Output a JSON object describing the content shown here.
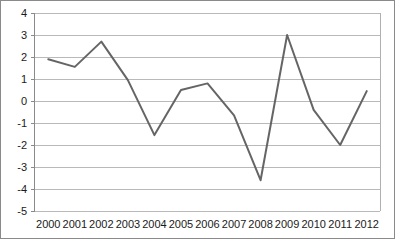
{
  "chart_data": {
    "type": "line",
    "title": "",
    "subtitle": "",
    "xlabel": "",
    "ylabel": "",
    "categories": [
      "2000",
      "2001",
      "2002",
      "2003",
      "2004",
      "2005",
      "2006",
      "2007",
      "2008",
      "2009",
      "2010",
      "2011",
      "2012"
    ],
    "series": [
      {
        "name": "",
        "values": [
          1.9,
          1.55,
          2.7,
          0.95,
          -1.55,
          0.5,
          0.8,
          -0.65,
          -3.6,
          3.0,
          -0.4,
          -2.0,
          0.45
        ]
      }
    ],
    "ylim": [
      -5,
      4
    ],
    "yticks": [
      4,
      3,
      2,
      1,
      0,
      -1,
      -2,
      -3,
      -4,
      -5
    ],
    "ytick_labels": [
      "4",
      "3",
      "2",
      "1",
      "0",
      "-1",
      "-2",
      "-3",
      "-4",
      "-5"
    ],
    "xtick_labels": [
      "2000",
      "2001",
      "2002",
      "2003",
      "2004",
      "2005",
      "2006",
      "2007",
      "2008",
      "2009",
      "2010",
      "2011",
      "2012"
    ],
    "grid": true,
    "grid_axis": "y",
    "legend": false,
    "legend_position": "none",
    "line_color": "#656565",
    "grid_color": "#b9b9b9",
    "axis_color": "#8a8a8a",
    "background_color": "#ffffff"
  },
  "caption": {
    "text": ""
  }
}
